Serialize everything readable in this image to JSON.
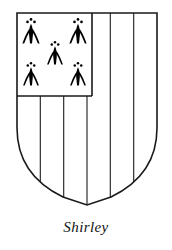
{
  "figure": {
    "kind": "heraldic-achievement",
    "caption": "Shirley",
    "blazon_summary": "Paly of six, a canton ermine",
    "colors": {
      "outline": "#1a1a1a",
      "field": "#ffffff",
      "charge": "#000000",
      "caption_text": "#111111",
      "background": "#ffffff"
    },
    "shield": {
      "name": "shield-escutcheon",
      "left": 17,
      "right": 157,
      "top": 13,
      "shoulder_y": 128,
      "point_y": 205,
      "outline_width": 1.6
    },
    "paly": {
      "name": "paly-of-six",
      "divisions": 6,
      "line_x": [
        40.3,
        63.7,
        87.0,
        110.3,
        133.7
      ],
      "line_width": 1.1
    },
    "canton": {
      "name": "canton-ermine",
      "position": "dexter-chief",
      "left": 17,
      "top": 13,
      "right": 92,
      "bottom": 96,
      "border_width": 1.6,
      "tincture": "ermine"
    },
    "ermine_spots": {
      "name": "ermine-spot-group",
      "count": 5,
      "arrangement": "quincunx 2-1-2",
      "positions": [
        {
          "label": "upper-dexter",
          "cx": 31,
          "cy": 30,
          "scale": 1.0
        },
        {
          "label": "upper-sinister",
          "cx": 78,
          "cy": 30,
          "scale": 1.0
        },
        {
          "label": "centre",
          "cx": 55,
          "cy": 52,
          "scale": 0.92
        },
        {
          "label": "lower-dexter",
          "cx": 31,
          "cy": 73,
          "scale": 0.92
        },
        {
          "label": "lower-sinister",
          "cx": 78,
          "cy": 73,
          "scale": 0.92
        }
      ]
    }
  }
}
